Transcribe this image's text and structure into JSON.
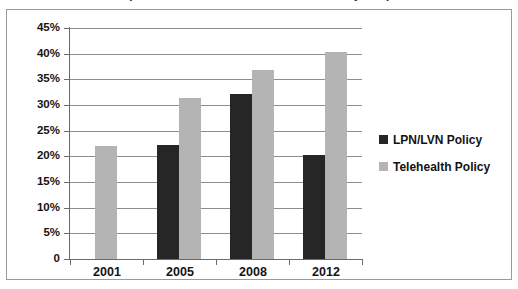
{
  "clipped_title": "Comparison of Telehealth and LPN/LVN Policy Adoption",
  "chart_data": {
    "type": "bar",
    "title": "",
    "xlabel": "",
    "ylabel": "",
    "categories": [
      "2001",
      "2005",
      "2008",
      "2012"
    ],
    "series": [
      {
        "name": "LPN/LVN Policy",
        "color": "#262626",
        "values": [
          null,
          22.3,
          32.2,
          20.2
        ]
      },
      {
        "name": "Telehealth Policy",
        "color": "#b4b4b4",
        "values": [
          22.1,
          31.3,
          36.8,
          40.3
        ]
      }
    ],
    "ylim": [
      0,
      45
    ],
    "ytick_values": [
      0,
      5,
      10,
      15,
      20,
      25,
      30,
      35,
      40,
      45
    ],
    "ytick_labels": [
      "0",
      "5%",
      "10%",
      "15%",
      "20%",
      "25%",
      "30%",
      "35%",
      "40%",
      "45%"
    ],
    "grid": true,
    "legend_position": "right"
  },
  "legend": {
    "entries": [
      {
        "label": "LPN/LVN Policy",
        "swatch": "s0"
      },
      {
        "label": "Telehealth Policy",
        "swatch": "s1"
      }
    ]
  }
}
